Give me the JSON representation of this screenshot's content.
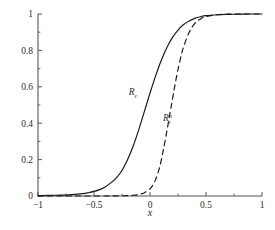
{
  "chart_data": {
    "type": "line",
    "title": "",
    "xlabel": "x",
    "ylabel": "",
    "xlim": [
      -1,
      1
    ],
    "ylim": [
      0,
      1
    ],
    "grid": false,
    "legend_position": "inline-annotations",
    "background_color": "#ffffff",
    "axis_color": "#555555",
    "x_ticks": [
      -1,
      -0.5,
      0,
      0.5,
      1
    ],
    "x_tick_labels": [
      "−1",
      "−0.5",
      "0",
      "0.5",
      "1"
    ],
    "x_minor_ticks": [
      -0.75,
      -0.25,
      0.25,
      0.75
    ],
    "y_ticks": [
      0,
      0.2,
      0.4,
      0.6,
      0.8,
      1
    ],
    "y_tick_labels": [
      "0",
      "0.2",
      "0.4",
      "0.6",
      "0.8",
      "1"
    ],
    "y_minor_ticks": [
      0.1,
      0.3,
      0.5,
      0.7,
      0.9
    ],
    "series": [
      {
        "name": "R_epsilon",
        "label_main": "R",
        "label_sub": "ε",
        "label_sup": "",
        "style": "solid",
        "color": "#1a1a1a",
        "line_width": 1.2,
        "center": -0.05,
        "x": [
          -1,
          -0.9,
          -0.8,
          -0.7,
          -0.6,
          -0.55,
          -0.5,
          -0.45,
          -0.4,
          -0.35,
          -0.3,
          -0.25,
          -0.2,
          -0.15,
          -0.1,
          -0.05,
          0,
          0.05,
          0.1,
          0.15,
          0.2,
          0.25,
          0.3,
          0.35,
          0.4,
          0.45,
          0.5,
          0.6,
          0.7,
          0.8,
          0.9,
          1
        ],
        "y": [
          0.002,
          0.003,
          0.005,
          0.008,
          0.013,
          0.018,
          0.025,
          0.035,
          0.05,
          0.072,
          0.1,
          0.14,
          0.2,
          0.275,
          0.365,
          0.465,
          0.565,
          0.66,
          0.745,
          0.815,
          0.87,
          0.912,
          0.942,
          0.962,
          0.976,
          0.985,
          0.991,
          0.996,
          0.998,
          0.999,
          1.0,
          1.0
        ]
      },
      {
        "name": "R_epsilon_n",
        "label_main": "R",
        "label_sub": "ε",
        "label_sup": "n",
        "style": "dashed",
        "color": "#1a1a1a",
        "line_width": 1.2,
        "center": 0.17,
        "x": [
          -1,
          -0.8,
          -0.6,
          -0.4,
          -0.3,
          -0.2,
          -0.15,
          -0.1,
          -0.05,
          0,
          0.02,
          0.05,
          0.08,
          0.1,
          0.12,
          0.15,
          0.18,
          0.2,
          0.22,
          0.25,
          0.28,
          0.3,
          0.35,
          0.4,
          0.45,
          0.5,
          0.6,
          0.7,
          0.8,
          0.9,
          1
        ],
        "y": [
          0.0,
          0.0,
          0.0,
          0.0,
          0.001,
          0.002,
          0.004,
          0.008,
          0.018,
          0.04,
          0.055,
          0.09,
          0.145,
          0.195,
          0.255,
          0.355,
          0.46,
          0.53,
          0.6,
          0.695,
          0.775,
          0.82,
          0.9,
          0.948,
          0.973,
          0.986,
          0.996,
          0.999,
          1.0,
          1.0,
          1.0
        ]
      }
    ],
    "annotations": [
      {
        "name": "label-R-epsilon",
        "text": "Rε",
        "x": -0.19,
        "y": 0.555
      },
      {
        "name": "label-R-epsilon-n",
        "text": "Rεⁿ",
        "x": 0.115,
        "y": 0.41
      }
    ]
  }
}
